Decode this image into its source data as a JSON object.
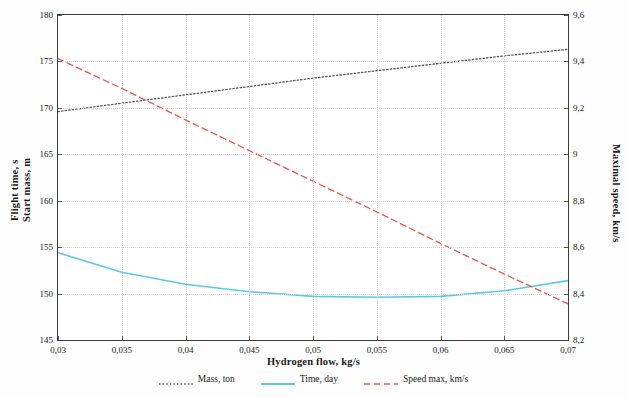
{
  "chart_data": {
    "type": "line",
    "title": "",
    "xlabel": "Hydrogen flow, kg/s",
    "ylabel_left": "Flight time, s\nStart mass, m",
    "ylabel_right": "Maximal speed, km/s",
    "xlim": [
      0.03,
      0.07
    ],
    "ylim_left": [
      145,
      180
    ],
    "ylim_right": [
      8.2,
      9.6
    ],
    "x_ticks": [
      "0,03",
      "0,035",
      "0,04",
      "0,045",
      "0,05",
      "0,055",
      "0,06",
      "0,065",
      "0,07"
    ],
    "x_tick_values": [
      0.03,
      0.035,
      0.04,
      0.045,
      0.05,
      0.055,
      0.06,
      0.065,
      0.07
    ],
    "y_left_ticks": [
      "145",
      "150",
      "155",
      "160",
      "165",
      "170",
      "175",
      "180"
    ],
    "y_left_tick_values": [
      145,
      150,
      155,
      160,
      165,
      170,
      175,
      180
    ],
    "y_right_ticks": [
      "8,2",
      "8,4",
      "8,6",
      "8,8",
      "9",
      "9,2",
      "9,4",
      "9,6"
    ],
    "y_right_tick_values": [
      8.2,
      8.4,
      8.6,
      8.8,
      9.0,
      9.2,
      9.4,
      9.6
    ],
    "grid": true,
    "legend_position": "bottom",
    "x": [
      0.03,
      0.035,
      0.04,
      0.045,
      0.05,
      0.055,
      0.06,
      0.065,
      0.07
    ],
    "series": [
      {
        "name": "Mass, ton",
        "label": "Mass, ton",
        "color": "#595959",
        "style": "dotted",
        "axis": "left",
        "values": [
          169.6,
          170.5,
          171.4,
          172.3,
          173.2,
          174.0,
          174.8,
          175.6,
          176.3
        ]
      },
      {
        "name": "Time, day",
        "label": "Time, day",
        "color": "#5bc8e8",
        "style": "solid",
        "axis": "left",
        "values": [
          154.4,
          152.3,
          151.0,
          150.2,
          149.7,
          149.6,
          149.7,
          150.3,
          151.4
        ]
      },
      {
        "name": "Speed max, km/s",
        "label": "Speed max, km/s",
        "color": "#e8584a",
        "style": "dashed",
        "axis": "left",
        "values": [
          175.3,
          172.1,
          168.7,
          165.4,
          162.1,
          158.8,
          155.4,
          152.1,
          148.9
        ]
      }
    ]
  }
}
